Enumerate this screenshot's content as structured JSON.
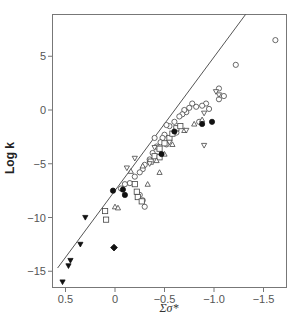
{
  "chart_data": {
    "type": "scatter",
    "title": "",
    "xlabel": "Σσ*",
    "ylabel": "Log k",
    "xlim": [
      0.63,
      -1.72
    ],
    "ylim": [
      -16.5,
      9.0
    ],
    "x_axis_reversed": true,
    "grid": false,
    "legend": null,
    "x_ticks": [
      0.5,
      0,
      -0.5,
      -1.0,
      -1.5
    ],
    "x_tick_labels": [
      "0.5",
      "0",
      "−0.5",
      "−1.0",
      "−1.5"
    ],
    "y_ticks": [
      5,
      0,
      -5,
      -10,
      -15
    ],
    "y_tick_labels": [
      "5",
      "0",
      "−5",
      "−10",
      "−15"
    ],
    "fit_line": {
      "x": [
        0.58,
        -1.32
      ],
      "y": [
        -14.7,
        8.9
      ]
    },
    "series": [
      {
        "name": "open circles",
        "marker": "circle-open",
        "points": [
          [
            -1.62,
            6.5
          ],
          [
            -1.22,
            4.2
          ],
          [
            -1.05,
            2.0
          ],
          [
            -1.1,
            1.3
          ],
          [
            -1.05,
            1.0
          ],
          [
            -0.92,
            0.6
          ],
          [
            -0.88,
            0.4
          ],
          [
            -0.82,
            0.3
          ],
          [
            -0.78,
            0.6
          ],
          [
            -0.75,
            0.2
          ],
          [
            -0.72,
            -0.2
          ],
          [
            -0.7,
            0.0
          ],
          [
            -0.68,
            -0.4
          ],
          [
            -0.65,
            -0.6
          ],
          [
            -0.6,
            -1.1
          ],
          [
            -0.55,
            -1.5
          ],
          [
            -0.52,
            -1.4
          ],
          [
            -0.5,
            -2.3
          ],
          [
            -0.48,
            -2.6
          ],
          [
            -0.46,
            -3.0
          ],
          [
            -0.42,
            -3.4
          ],
          [
            -0.38,
            -4.0
          ],
          [
            -0.35,
            -4.6
          ],
          [
            -0.3,
            -5.1
          ],
          [
            -0.28,
            -5.5
          ],
          [
            -0.25,
            -5.8
          ],
          [
            -0.2,
            -6.2
          ],
          [
            -0.15,
            -6.8
          ],
          [
            -0.1,
            -6.9
          ],
          [
            -0.06,
            -7.3
          ],
          [
            -0.25,
            -7.9
          ],
          [
            -0.28,
            -8.4
          ],
          [
            -0.3,
            -9.0
          ],
          [
            -0.52,
            -3.2
          ],
          [
            -0.62,
            -2.1
          ],
          [
            -0.4,
            -2.6
          ],
          [
            -0.85,
            -1.1
          ],
          [
            -0.95,
            0.1
          ]
        ]
      },
      {
        "name": "open squares",
        "marker": "square-open",
        "points": [
          [
            0.1,
            -9.4
          ],
          [
            0.09,
            -10.2
          ],
          [
            -0.2,
            -6.9
          ],
          [
            -0.22,
            -7.6
          ],
          [
            -0.23,
            -8.1
          ],
          [
            -0.27,
            -8.5
          ],
          [
            -0.36,
            -4.8
          ],
          [
            -0.4,
            -4.3
          ],
          [
            -0.45,
            -4.4
          ],
          [
            -0.5,
            -3.1
          ],
          [
            -0.55,
            -2.6
          ],
          [
            -0.58,
            -2.2
          ],
          [
            -0.62,
            -1.7
          ],
          [
            -0.66,
            -1.5
          ],
          [
            -0.45,
            -3.6
          ]
        ]
      },
      {
        "name": "open triangles",
        "marker": "triangle-up-open",
        "points": [
          [
            0.0,
            -9.0
          ],
          [
            -0.03,
            -9.1
          ],
          [
            -0.16,
            -5.7
          ],
          [
            -0.28,
            -5.2
          ],
          [
            -0.33,
            -6.9
          ],
          [
            -0.42,
            -4.7
          ],
          [
            -0.45,
            -5.8
          ],
          [
            -0.5,
            -4.1
          ],
          [
            -0.58,
            -3.2
          ],
          [
            -0.7,
            -1.9
          ],
          [
            -0.8,
            -1.3
          ],
          [
            -0.88,
            -0.9
          ]
        ]
      },
      {
        "name": "open inverted triangles",
        "marker": "triangle-down-open",
        "points": [
          [
            -0.12,
            -5.4
          ],
          [
            -0.2,
            -4.5
          ],
          [
            -0.35,
            -5.0
          ],
          [
            -0.4,
            -3.5
          ],
          [
            -0.55,
            -3.0
          ],
          [
            -0.72,
            -1.9
          ],
          [
            -0.9,
            -3.3
          ],
          [
            -1.05,
            1.4
          ],
          [
            -1.02,
            1.7
          ],
          [
            -0.9,
            -0.3
          ]
        ]
      },
      {
        "name": "filled circles",
        "marker": "circle-filled",
        "points": [
          [
            0.02,
            -7.5
          ],
          [
            -0.08,
            -7.4
          ],
          [
            -0.1,
            -7.9
          ],
          [
            -0.47,
            -4.1
          ],
          [
            -0.6,
            -2.0
          ],
          [
            -0.98,
            -1.1
          ],
          [
            -0.88,
            -1.3
          ]
        ]
      },
      {
        "name": "filled inverted triangles",
        "marker": "triangle-down-filled",
        "points": [
          [
            0.3,
            -10.0
          ],
          [
            0.35,
            -12.5
          ],
          [
            0.45,
            -14.0
          ],
          [
            0.47,
            -14.5
          ],
          [
            0.53,
            -16.0
          ]
        ]
      },
      {
        "name": "filled diamond",
        "marker": "diamond-filled",
        "points": [
          [
            0.01,
            -12.8
          ]
        ]
      }
    ]
  }
}
